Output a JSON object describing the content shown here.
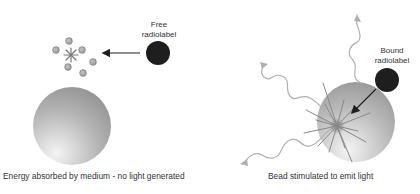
{
  "left_panel": {
    "free_label_line1": "Free",
    "free_label_line2": "radiolabel",
    "caption": "Energy absorbed by medium - no light generated"
  },
  "right_panel": {
    "bound_label_line1": "Bound",
    "bound_label_line2": "radiolabel",
    "caption": "Bead stimulated to emit light"
  },
  "colors": {
    "radiolabel": "#1e1e1e",
    "bead_dark": "#8a8a8a",
    "bead_light": "#f2f2f2",
    "particle": "#a8a8a8",
    "wave": "#b0b0b0",
    "text": "#333333"
  }
}
